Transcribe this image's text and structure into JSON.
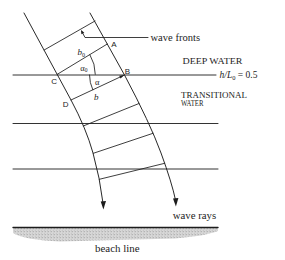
{
  "figure": {
    "colors": {
      "ink": "#1c1c1c",
      "sand": "#cfcfcf",
      "background": "#ffffff"
    },
    "labels": {
      "wave_fronts": "wave fronts",
      "deep_water": "DEEP WATER",
      "contour": {
        "h_over_L": "h/L",
        "sub": "0",
        "value": " = 0.5"
      },
      "transitional_line1": "TRANSITIONAL",
      "transitional_line2": "WATER",
      "wave_rays": "wave rays",
      "beach_line": "beach line",
      "points": {
        "A": "A",
        "B": "B",
        "C": "C",
        "D": "D"
      },
      "b0": {
        "base": "b",
        "sub": "0"
      },
      "alpha0": {
        "base": "α",
        "sub": "0"
      },
      "alpha": "α",
      "b": "b"
    },
    "elements": {
      "depth_contours": 3,
      "wave_rays": 2,
      "wave_fronts": 6
    }
  }
}
